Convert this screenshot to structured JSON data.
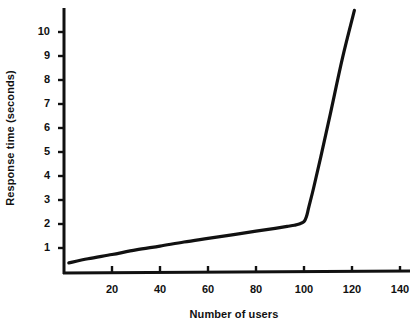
{
  "chart_data": {
    "type": "line",
    "title": "",
    "xlabel": "Number of users",
    "ylabel": "Response time (seconds)",
    "xlim": [
      0,
      148
    ],
    "ylim": [
      0,
      11.2
    ],
    "grid": false,
    "legend": null,
    "x_ticks": [
      20,
      40,
      60,
      80,
      100,
      120,
      140
    ],
    "x_tick_labels": [
      "20",
      "40",
      "60",
      "80",
      "100",
      "120",
      "140"
    ],
    "y_ticks": [
      1,
      2,
      3,
      4,
      5,
      6,
      7,
      8,
      9,
      10
    ],
    "y_tick_labels": [
      "1",
      "2",
      "3",
      "4",
      "5",
      "6",
      "7",
      "8",
      "9",
      "10"
    ],
    "series": [
      {
        "name": "Response time",
        "color": "#111111",
        "line_width": 3,
        "x": [
          2,
          10,
          20,
          30,
          40,
          50,
          60,
          70,
          80,
          88,
          93,
          96,
          98,
          100,
          101,
          102,
          104,
          107,
          111,
          116,
          121
        ],
        "y": [
          0.38,
          0.55,
          0.73,
          0.92,
          1.08,
          1.25,
          1.4,
          1.55,
          1.7,
          1.82,
          1.9,
          1.95,
          2.0,
          2.1,
          2.3,
          2.7,
          3.5,
          4.8,
          6.6,
          8.9,
          10.9
        ]
      }
    ],
    "annotations": []
  },
  "axes": {
    "y_title": "Response time (seconds)",
    "x_title": "Number of users"
  }
}
